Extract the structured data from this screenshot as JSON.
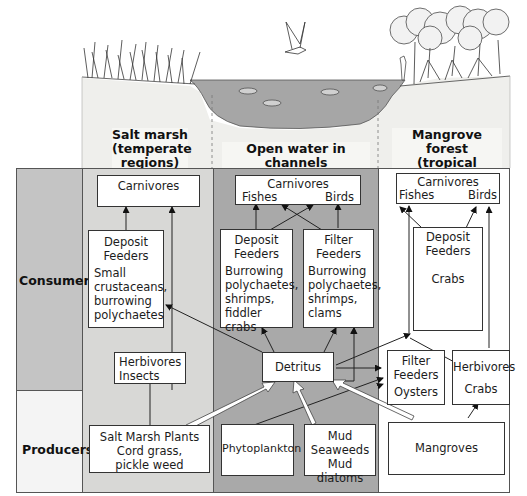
{
  "regions": {
    "salt_marsh": {
      "title": "Salt marsh",
      "subtitle_1": "(temperate",
      "subtitle_2": "regions)"
    },
    "open_water": {
      "title": "Open water in channels",
      "subtitle": "and muddy bottom"
    },
    "mangrove": {
      "title": "Mangrove forest",
      "subtitle_1": "(tropical",
      "subtitle_2": "regions)"
    }
  },
  "rows": {
    "consumers": "Consumers",
    "producers": "Producers"
  },
  "colors": {
    "left_label_bg": "#c4c4c4",
    "producers_label_bg": "#f4f4f4",
    "salt_marsh_bg": "#d8d8d6",
    "open_water_bg": "#a9a9a9",
    "mangrove_bg": "#ffffff",
    "water_fill": "#a6a6a6",
    "soil_fill": "#efefec"
  },
  "salt_marsh": {
    "carnivores": "Carnivores",
    "deposit_feeders": {
      "title_1": "Deposit",
      "title_2": "Feeders",
      "desc": [
        "Small",
        "crustaceans,",
        "burrowing",
        "polychaetes"
      ]
    },
    "herbivores": {
      "title": "Herbivores",
      "desc": "Insects"
    },
    "producers": {
      "title": "Salt Marsh Plants",
      "desc_1": "Cord grass,",
      "desc_2": "pickle weed"
    }
  },
  "open_water": {
    "carnivores": {
      "title": "Carnivores",
      "fishes": "Fishes",
      "birds": "Birds"
    },
    "deposit_feeders": {
      "title_1": "Deposit",
      "title_2": "Feeders",
      "desc": [
        "Burrowing",
        "polychaetes,",
        "shrimps,",
        "fiddler",
        "crabs"
      ]
    },
    "filter_feeders": {
      "title_1": "Filter",
      "title_2": "Feeders",
      "desc": [
        "Burrowing",
        "polychaetes,",
        "shrimps,",
        "clams"
      ]
    },
    "detritus": "Detritus",
    "phytoplankton": "Phytoplankton",
    "mud": {
      "line_1": "Mud",
      "line_2": "Seaweeds",
      "line_3": "Mud diatoms"
    }
  },
  "mangrove": {
    "carnivores": {
      "title": "Carnivores",
      "fishes": "Fishes",
      "birds": "Birds"
    },
    "deposit_feeders": {
      "title_1": "Deposit",
      "title_2": "Feeders",
      "desc": "Crabs"
    },
    "filter_feeders": {
      "title_1": "Filter",
      "title_2": "Feeders",
      "desc": "Oysters"
    },
    "herbivores": {
      "title": "Herbivores",
      "desc": "Crabs"
    },
    "producers": "Mangroves"
  }
}
